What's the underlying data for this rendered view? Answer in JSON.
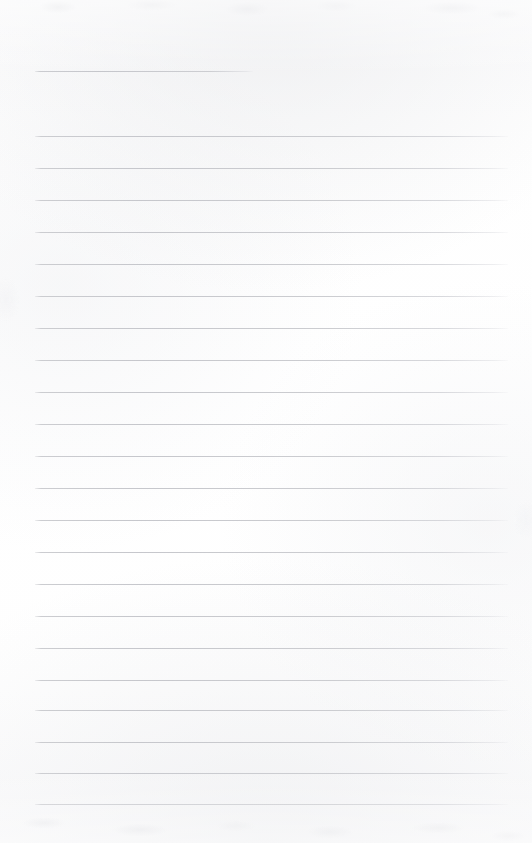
{
  "document": {
    "kind": "scanned-lined-paper",
    "title": "Blank Lined Notebook Page",
    "orientation": "portrait",
    "page_width": 532,
    "page_height": 843,
    "background_color": "#fdfdfd",
    "rule_color": "#c9cace",
    "rule_thickness": 1,
    "rule_spacing": 32,
    "written_content": "",
    "header_text": "",
    "footer_text": "",
    "page_number": ""
  },
  "margins": {
    "left": 35,
    "right": 508,
    "top_first_rule": 71,
    "bottom_last_rule": 804
  },
  "rules": [
    {
      "id": "rule-title",
      "type": "short",
      "y": 71,
      "x_start": 35,
      "x_end": 253
    },
    {
      "id": "rule-01",
      "type": "full",
      "y": 136,
      "x_start": 35,
      "x_end": 508
    },
    {
      "id": "rule-02",
      "type": "full",
      "y": 168,
      "x_start": 35,
      "x_end": 508
    },
    {
      "id": "rule-03",
      "type": "full",
      "y": 200,
      "x_start": 35,
      "x_end": 508
    },
    {
      "id": "rule-04",
      "type": "full",
      "y": 232,
      "x_start": 35,
      "x_end": 508
    },
    {
      "id": "rule-05",
      "type": "full",
      "y": 264,
      "x_start": 35,
      "x_end": 508
    },
    {
      "id": "rule-06",
      "type": "full",
      "y": 296,
      "x_start": 35,
      "x_end": 508
    },
    {
      "id": "rule-07",
      "type": "full",
      "y": 328,
      "x_start": 35,
      "x_end": 508
    },
    {
      "id": "rule-08",
      "type": "full",
      "y": 360,
      "x_start": 35,
      "x_end": 508
    },
    {
      "id": "rule-09",
      "type": "full",
      "y": 392,
      "x_start": 35,
      "x_end": 508
    },
    {
      "id": "rule-10",
      "type": "full",
      "y": 424,
      "x_start": 35,
      "x_end": 508
    },
    {
      "id": "rule-11",
      "type": "full",
      "y": 456,
      "x_start": 35,
      "x_end": 508
    },
    {
      "id": "rule-12",
      "type": "full",
      "y": 488,
      "x_start": 35,
      "x_end": 508
    },
    {
      "id": "rule-13",
      "type": "full",
      "y": 520,
      "x_start": 35,
      "x_end": 508
    },
    {
      "id": "rule-14",
      "type": "full",
      "y": 552,
      "x_start": 35,
      "x_end": 508
    },
    {
      "id": "rule-15",
      "type": "full",
      "y": 584,
      "x_start": 35,
      "x_end": 508
    },
    {
      "id": "rule-16",
      "type": "full",
      "y": 616,
      "x_start": 35,
      "x_end": 508
    },
    {
      "id": "rule-17",
      "type": "full",
      "y": 648,
      "x_start": 35,
      "x_end": 508
    },
    {
      "id": "rule-18",
      "type": "full",
      "y": 680,
      "x_start": 35,
      "x_end": 508
    },
    {
      "id": "rule-19",
      "type": "full",
      "y": 710,
      "x_start": 35,
      "x_end": 508
    },
    {
      "id": "rule-20",
      "type": "full",
      "y": 742,
      "x_start": 35,
      "x_end": 508
    },
    {
      "id": "rule-21",
      "type": "full",
      "y": 773,
      "x_start": 35,
      "x_end": 508
    },
    {
      "id": "rule-22",
      "type": "full",
      "y": 804,
      "x_start": 35,
      "x_end": 508
    }
  ]
}
